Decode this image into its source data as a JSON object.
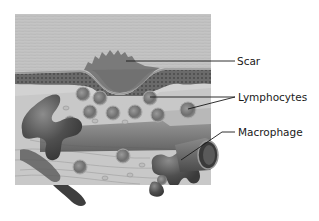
{
  "figure": {
    "labels": [
      {
        "id": "scar",
        "text": "Scar"
      },
      {
        "id": "lymphocytes",
        "text": "Lymphocytes"
      },
      {
        "id": "macrophage",
        "text": "Macrophage"
      }
    ]
  },
  "colors": {
    "background": "#ffffff",
    "epidermis": "#bdbdbd",
    "scar": "#7a7a7a",
    "tissue": "#cfcfcf",
    "cell_dark": "#5a5a5a",
    "leader_line": "#1a1a1a"
  }
}
